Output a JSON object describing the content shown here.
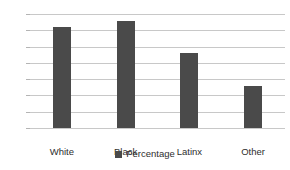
{
  "chart_data": {
    "type": "bar",
    "title": "",
    "subtitle": "",
    "xlabel": "",
    "ylabel": "",
    "categories": [
      "White",
      "Black",
      "Latinx",
      "Other"
    ],
    "values": [
      31,
      33,
      23,
      13
    ],
    "series": [
      {
        "name": "Percentage",
        "values": [
          31,
          33,
          23,
          13
        ]
      }
    ],
    "ylim": [
      0,
      35
    ],
    "ytick_step": 5,
    "ytick_labels": [
      "0%",
      "5%",
      "10%",
      "15%",
      "20%",
      "25%",
      "30%",
      "35%"
    ],
    "ytick_values": [
      0,
      5,
      10,
      15,
      20,
      25,
      30,
      35
    ],
    "grid": true,
    "grid_axis": "y",
    "legend": {
      "visible": true,
      "position": "bottom",
      "entries": [
        {
          "label": "Percentage",
          "marker": "square",
          "color": "#4a4a4a"
        }
      ]
    },
    "colors": {
      "bar": "#4a4a4a",
      "gridline": "#c8c8c8",
      "tick": "#b4b4b4",
      "text": "#2e2e2e",
      "background": "#ffffff"
    }
  }
}
